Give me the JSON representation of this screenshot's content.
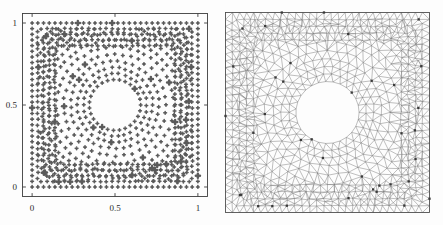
{
  "figure": {
    "background": "#fdfdfd",
    "panel_count": 2
  },
  "chart_data": [
    {
      "type": "scatter",
      "id": "node-distribution",
      "title": "",
      "xlabel": "",
      "ylabel": "",
      "xlim": [
        -0.06,
        1.06
      ],
      "ylim": [
        -0.06,
        1.06
      ],
      "xticks": [
        0,
        0.5,
        1
      ],
      "xticklabels": [
        "0",
        "0.5",
        "1"
      ],
      "yticks": [
        0,
        0.5,
        1
      ],
      "yticklabels": [
        "0",
        "0.5",
        "1"
      ],
      "grid": false,
      "legend": null,
      "frame": true,
      "marker": {
        "shape": "diamond-cluster",
        "color": "#5a5a5a",
        "size_small": 2.6,
        "size_large": 4.0
      },
      "hole": {
        "shape": "circle",
        "cx": 0.5,
        "cy": 0.5,
        "r": 0.155
      },
      "description": "Adaptive point cloud on unit square with circular void; graded spacing from boundary toward the hole; a subset of nodes drawn with larger markers.",
      "n_points_approx": 470,
      "boundary_spacing": 0.0345,
      "interior_spacing_min": 0.036,
      "interior_spacing_max": 0.052
    },
    {
      "type": "mesh",
      "id": "delaunay-triangulation",
      "title": "",
      "xlabel": "",
      "ylabel": "",
      "xlim": [
        -0.02,
        1.02
      ],
      "ylim": [
        -0.02,
        1.02
      ],
      "xticks": [],
      "xticklabels": [],
      "yticks": [],
      "yticklabels": [],
      "grid": false,
      "legend": null,
      "frame": true,
      "edge_color": "#6f6f6f",
      "node_color": "#3a3a3a",
      "hole": {
        "shape": "circle",
        "cx": 0.5,
        "cy": 0.5,
        "r": 0.158
      },
      "description": "Unstructured triangular (Delaunay) mesh of the same domain; triangles grade in size around the circular hole; scattered highlighted nodes drawn as filled squares.",
      "n_nodes_approx": 470,
      "n_triangles_approx": 880
    }
  ],
  "left_panel": {
    "name": "point-distribution-plot",
    "axis": {
      "x_ticks": [
        {
          "value": 0,
          "label": "0"
        },
        {
          "value": 0.5,
          "label": "0.5"
        },
        {
          "value": 1,
          "label": "1"
        }
      ],
      "y_ticks": [
        {
          "value": 0,
          "label": "0"
        },
        {
          "value": 0.5,
          "label": "0.5"
        },
        {
          "value": 1,
          "label": "1"
        }
      ]
    }
  },
  "right_panel": {
    "name": "triangular-mesh-plot"
  }
}
